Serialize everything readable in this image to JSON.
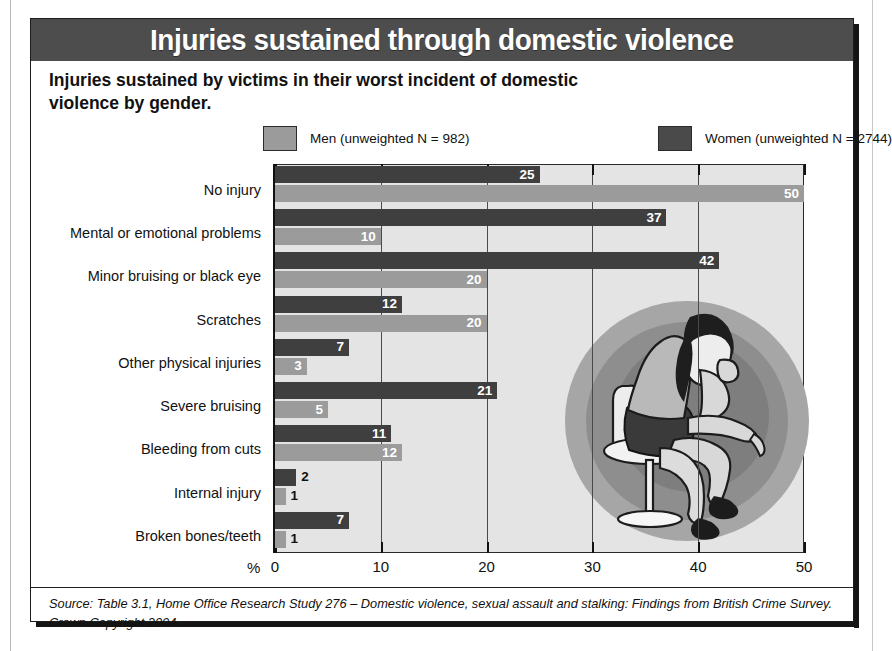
{
  "figure": {
    "title": "Injuries sustained through domestic violence",
    "subtitle": "Injuries sustained by victims in their worst incident of domestic violence by gender.",
    "source": "Source: Table 3.1, Home Office Research Study 276 – Domestic violence, sexual assault and stalking: Findings from British Crime Survey. Crown Copyright 2004.",
    "illustration_name": "seated-woman-illustration"
  },
  "colors": {
    "men": "#9b9b9b",
    "women": "#3f3f3f",
    "title_bar": "#4d4d4d",
    "plot_background": "#e4e4e4",
    "axis": "#111111"
  },
  "chart_data": {
    "type": "bar",
    "orientation": "horizontal",
    "title": "Injuries sustained through domestic violence",
    "subtitle": "Injuries sustained by victims in their worst incident of domestic violence by gender.",
    "xlabel": "%",
    "ylabel": "",
    "xlim": [
      0,
      50
    ],
    "xticks": [
      0,
      10,
      20,
      30,
      40,
      50
    ],
    "xtick_labels": [
      "0",
      "10",
      "20",
      "30",
      "40",
      "50"
    ],
    "grid": true,
    "legend_position": "top",
    "categories": [
      "No injury",
      "Mental or emotional problems",
      "Minor bruising or black eye",
      "Scratches",
      "Other physical injuries",
      "Severe bruising",
      "Bleeding from cuts",
      "Internal injury",
      "Broken bones/teeth"
    ],
    "series": [
      {
        "name": "Women (unweighted N = 2744)",
        "short_name": "Women",
        "unweighted_n": 2744,
        "color": "#3f3f3f",
        "values": [
          25,
          37,
          42,
          12,
          7,
          21,
          11,
          2,
          7
        ]
      },
      {
        "name": "Men (unweighted N = 982)",
        "short_name": "Men",
        "unweighted_n": 982,
        "color": "#9b9b9b",
        "values": [
          50,
          10,
          20,
          20,
          3,
          5,
          12,
          1,
          1
        ]
      }
    ]
  }
}
